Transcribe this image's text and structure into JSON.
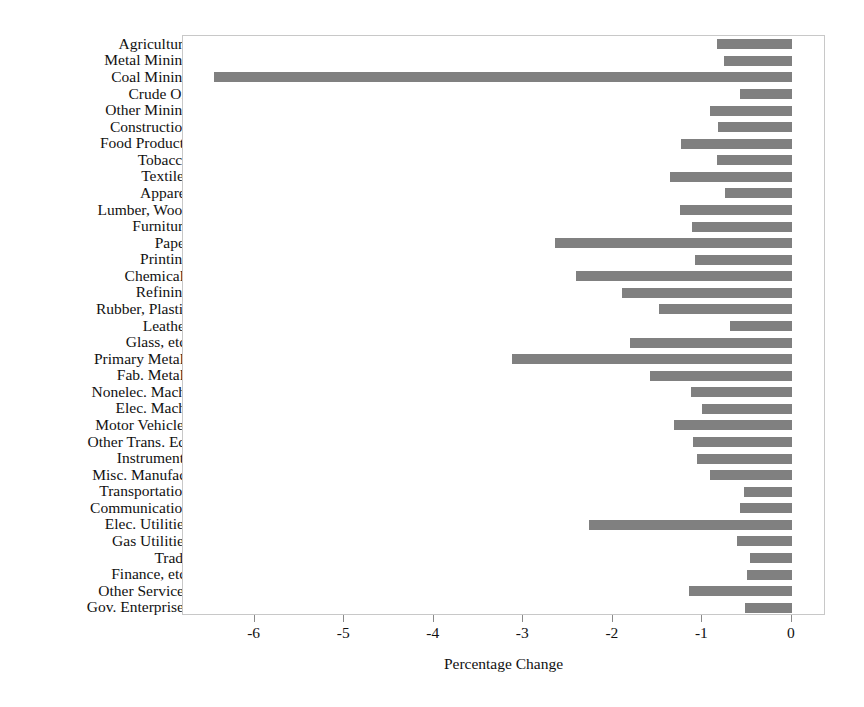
{
  "chart_data": {
    "type": "bar",
    "orientation": "horizontal",
    "title": "",
    "xlabel": "Percentage Change",
    "ylabel": "",
    "xlim": [
      -6.8,
      0.38
    ],
    "xticks": [
      -6,
      -5,
      -4,
      -3,
      -2,
      -1,
      0
    ],
    "xticklabels": [
      "-6",
      "-5",
      "-4",
      "-3",
      "-2",
      "-1",
      "0"
    ],
    "grid": false,
    "legend": null,
    "bar_color": "#808080",
    "frame_color": "#c8c8c8",
    "categories": [
      "Agriculture",
      "Metal Mining",
      "Coal Mining",
      "Crude Oil",
      "Other Mining",
      "Construction",
      "Food Products",
      "Tobacco",
      "Textiles",
      "Apparel",
      "Lumber, Wood",
      "Furniture",
      "Paper",
      "Printing",
      "Chemicals",
      "Refining",
      "Rubber, Plastic",
      "Leather",
      "Glass, etc.",
      "Primary Metals",
      "Fab. Metals",
      "Nonelec. Mach.",
      "Elec. Mach.",
      "Motor Vehicles",
      "Other Trans. Eq.",
      "Instruments",
      "Misc. Manufac.",
      "Transportation",
      "Communication",
      "Elec. Utilities",
      "Gas Utilities",
      "Trade",
      "Finance, etc.",
      "Other Services",
      "Gov. Enterprises"
    ],
    "values": [
      -0.84,
      -0.76,
      -6.45,
      -0.58,
      -0.92,
      -0.83,
      -1.24,
      -0.84,
      -1.36,
      -0.75,
      -1.25,
      -1.12,
      -2.65,
      -1.08,
      -2.41,
      -1.9,
      -1.48,
      -0.69,
      -1.81,
      -3.13,
      -1.58,
      -1.13,
      -1.0,
      -1.32,
      -1.11,
      -1.06,
      -0.92,
      -0.54,
      -0.58,
      -2.27,
      -0.61,
      -0.47,
      -0.5,
      -1.15,
      -0.53
    ]
  }
}
